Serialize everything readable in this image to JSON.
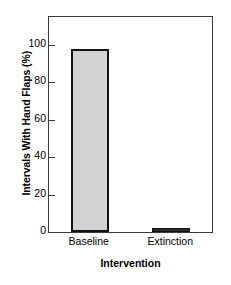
{
  "chart_data": {
    "type": "bar",
    "title": "",
    "subtitle": "",
    "categories": [
      "Baseline",
      "Extinction"
    ],
    "values": [
      98,
      2
    ],
    "series": [
      {
        "name": "Intervals With Hand Flaps",
        "values": [
          98,
          2
        ]
      }
    ],
    "xlabel": "Intervention",
    "ylabel": "Intervals With Hand Flaps (%)",
    "ylim": [
      0,
      115
    ],
    "xlim": [
      0,
      2
    ],
    "yticks": [
      0,
      20,
      40,
      60,
      80,
      100
    ],
    "ytick_labels": [
      "0",
      "20",
      "40",
      "60",
      "80",
      "100"
    ],
    "xtick_labels": [
      "Baseline",
      "Extinction"
    ],
    "grid": false,
    "legend": false,
    "legend_position": "none",
    "tick_direction": "in",
    "colors": {
      "bar_fill": "#d2d2d2",
      "bar_edge": "#111111",
      "axis": "#3a3a3a",
      "text": "#000000",
      "background": "#ffffff"
    }
  },
  "axes": {
    "y_title": "Intervals With Hand Flaps (%)",
    "x_title": "Intervention"
  }
}
